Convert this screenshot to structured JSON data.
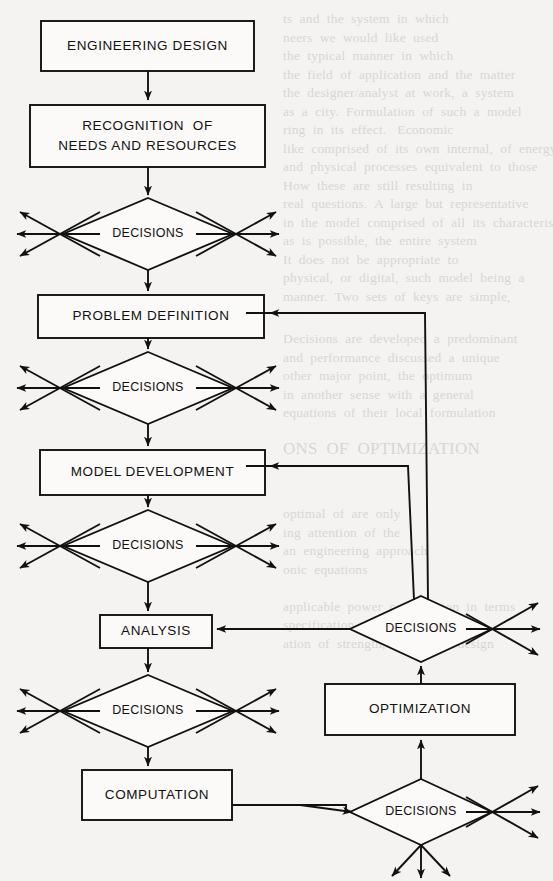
{
  "diagram": {
    "type": "flowchart",
    "background_color": "#f4f3f1",
    "line_color": "#111111",
    "nodes": [
      {
        "id": "engineering-design",
        "label": "ENGINEERING DESIGN",
        "shape": "rect",
        "x": 41,
        "y": 21,
        "w": 213,
        "h": 50
      },
      {
        "id": "recognition",
        "label": "RECOGNITION  OF\nNEEDS AND RESOURCES",
        "shape": "rect",
        "x": 30,
        "y": 105,
        "w": 235,
        "h": 62
      },
      {
        "id": "decisions-1",
        "label": "DECISIONS",
        "shape": "diamond",
        "x": 63,
        "y": 198,
        "w": 170,
        "h": 72
      },
      {
        "id": "problem-definition",
        "label": "PROBLEM DEFINITION",
        "shape": "rect",
        "x": 38,
        "y": 295,
        "w": 226,
        "h": 43
      },
      {
        "id": "decisions-2",
        "label": "DECISIONS",
        "shape": "diamond",
        "x": 63,
        "y": 352,
        "w": 170,
        "h": 72
      },
      {
        "id": "model-development",
        "label": "MODEL DEVELOPMENT",
        "shape": "rect",
        "x": 40,
        "y": 450,
        "w": 225,
        "h": 45
      },
      {
        "id": "decisions-3",
        "label": "DECISIONS",
        "shape": "diamond",
        "x": 63,
        "y": 510,
        "w": 170,
        "h": 72
      },
      {
        "id": "analysis",
        "label": "ANALYSIS",
        "shape": "rect",
        "x": 100,
        "y": 615,
        "w": 112,
        "h": 33
      },
      {
        "id": "decisions-4",
        "label": "DECISIONS",
        "shape": "diamond",
        "x": 63,
        "y": 675,
        "w": 170,
        "h": 72
      },
      {
        "id": "computation",
        "label": "COMPUTATION",
        "shape": "rect",
        "x": 82,
        "y": 770,
        "w": 150,
        "h": 50
      },
      {
        "id": "decisions-5",
        "label": "DECISIONS",
        "shape": "diamond",
        "x": 350,
        "y": 596,
        "w": 142,
        "h": 66
      },
      {
        "id": "optimization",
        "label": "OPTIMIZATION",
        "shape": "rect",
        "x": 325,
        "y": 684,
        "w": 190,
        "h": 51
      },
      {
        "id": "decisions-6",
        "label": "DECISIONS",
        "shape": "diamond",
        "x": 350,
        "y": 779,
        "w": 142,
        "h": 66
      }
    ],
    "edges": [
      {
        "id": "edge-design-to-recognition",
        "from": "engineering-design",
        "to": "recognition"
      },
      {
        "id": "edge-recognition-to-decisions1",
        "from": "recognition",
        "to": "decisions-1"
      },
      {
        "id": "edge-decisions1-to-problem",
        "from": "decisions-1",
        "to": "problem-definition"
      },
      {
        "id": "edge-problem-to-decisions2",
        "from": "problem-definition",
        "to": "decisions-2"
      },
      {
        "id": "edge-decisions2-to-model",
        "from": "decisions-2",
        "to": "model-development"
      },
      {
        "id": "edge-model-to-decisions3",
        "from": "model-development",
        "to": "decisions-3"
      },
      {
        "id": "edge-decisions3-to-analysis",
        "from": "decisions-3",
        "to": "analysis"
      },
      {
        "id": "edge-analysis-to-decisions4",
        "from": "analysis",
        "to": "decisions-4"
      },
      {
        "id": "edge-decisions4-to-computation",
        "from": "decisions-4",
        "to": "computation"
      },
      {
        "id": "edge-computation-to-decisions6",
        "from": "computation",
        "to": "decisions-6"
      },
      {
        "id": "edge-decisions6-to-optimization",
        "from": "decisions-6",
        "to": "optimization"
      },
      {
        "id": "edge-optimization-to-decisions5",
        "from": "optimization",
        "to": "decisions-5"
      },
      {
        "id": "edge-decisions5-to-analysis",
        "from": "decisions-5",
        "to": "analysis"
      },
      {
        "id": "edge-decisions5-to-model",
        "from": "decisions-5",
        "to": "model-development"
      },
      {
        "id": "edge-decisions5-to-problem",
        "from": "decisions-5",
        "to": "problem-definition"
      }
    ],
    "fan_arrow_groups": [
      {
        "id": "fan-decisions-1-left",
        "node": "decisions-1",
        "side": "left",
        "count": 3
      },
      {
        "id": "fan-decisions-1-right",
        "node": "decisions-1",
        "side": "right",
        "count": 3
      },
      {
        "id": "fan-decisions-2-left",
        "node": "decisions-2",
        "side": "left",
        "count": 3
      },
      {
        "id": "fan-decisions-2-right",
        "node": "decisions-2",
        "side": "right",
        "count": 3
      },
      {
        "id": "fan-decisions-3-left",
        "node": "decisions-3",
        "side": "left",
        "count": 3
      },
      {
        "id": "fan-decisions-3-right",
        "node": "decisions-3",
        "side": "right",
        "count": 3
      },
      {
        "id": "fan-decisions-4-left",
        "node": "decisions-4",
        "side": "left",
        "count": 3
      },
      {
        "id": "fan-decisions-4-right",
        "node": "decisions-4",
        "side": "right",
        "count": 3
      },
      {
        "id": "fan-decisions-5-right",
        "node": "decisions-5",
        "side": "right",
        "count": 3
      },
      {
        "id": "fan-decisions-6-right",
        "node": "decisions-6",
        "side": "right",
        "count": 3
      },
      {
        "id": "fan-decisions-6-bottom",
        "node": "decisions-6",
        "side": "bottom",
        "count": 3
      }
    ]
  },
  "labels": {
    "engineering_design": "ENGINEERING DESIGN",
    "recognition_line1": "RECOGNITION  OF",
    "recognition_line2": "NEEDS AND RESOURCES",
    "problem_definition": "PROBLEM DEFINITION",
    "model_development": "MODEL DEVELOPMENT",
    "analysis": "ANALYSIS",
    "computation": "COMPUTATION",
    "optimization": "OPTIMIZATION",
    "decisions_1": "DECISIONS",
    "decisions_2": "DECISIONS",
    "decisions_3": "DECISIONS",
    "decisions_4": "DECISIONS",
    "decisions_5": "DECISIONS",
    "decisions_6": "DECISIONS"
  },
  "bleed_through_text": {
    "note": "Faint show-through text from reverse page",
    "lines": [
      "ts and the system in which they are used, the",
      "neers we would like used the",
      "the typical manner in which the",
      "the field of application and the matter under consideration",
      "the designer/analyst at work, a system of the",
      "as a city. Formulation of such a model requires",
      "ring in its effect. Economic",
      "e like comprised of its own internal, of energy sav-",
      "and physical processes equivalent to those being repre-",
      "How these are still resulting in",
      "real questions. A large but representative sampling of",
      "in the model comprised of all its characteristics, usually",
      "as is possible, the entire system",
      "It does not be appropriate to",
      "physical, or digital, such model being constructed a simple a",
      "manner. Two sets of keys are simple,"
    ],
    "lines_mid": [
      "Decisions are developed a predominant of the applica-",
      "and performance discussed a unique character of appro-",
      "other major point, the optimum of the same",
      "in another sense with a general or the",
      "equations of their local formulation"
    ],
    "heading": "ONS OF OPTIMIZATION IN DESIGN",
    "lines_bottom": [
      "optimal of are only",
      "ing attention of the",
      "an engineering approach",
      "onic equations",
      "applicable power combination in terms are of design",
      "specification of a set of optimum circumstances which",
      "ation of strength, the actual design and, an economic"
    ]
  }
}
